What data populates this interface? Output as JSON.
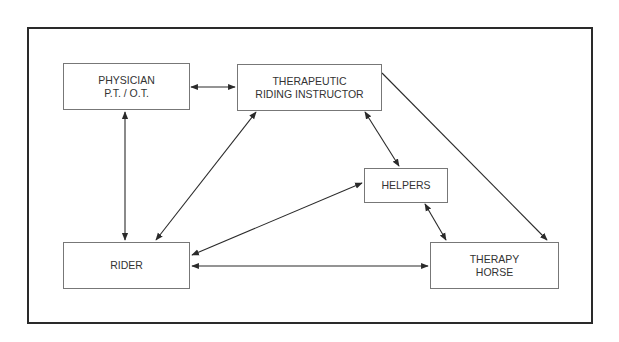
{
  "diagram": {
    "nodes": {
      "physician": {
        "line1": "PHYSICIAN",
        "line2": "P.T. / O.T."
      },
      "instructor": {
        "line1": "THERAPEUTIC",
        "line2": "RIDING INSTRUCTOR"
      },
      "helpers": {
        "line1": "HELPERS"
      },
      "rider": {
        "line1": "RIDER"
      },
      "horse": {
        "line1": "THERAPY",
        "line2": "HORSE"
      }
    },
    "edges": [
      {
        "from": "physician",
        "to": "instructor",
        "direction": "both"
      },
      {
        "from": "physician",
        "to": "rider",
        "direction": "both"
      },
      {
        "from": "instructor",
        "to": "rider",
        "direction": "both"
      },
      {
        "from": "instructor",
        "to": "helpers",
        "direction": "both"
      },
      {
        "from": "instructor",
        "to": "horse",
        "direction": "forward"
      },
      {
        "from": "helpers",
        "to": "rider",
        "direction": "both"
      },
      {
        "from": "helpers",
        "to": "horse",
        "direction": "both"
      },
      {
        "from": "rider",
        "to": "horse",
        "direction": "both"
      }
    ],
    "line_color": "#2a2a2a"
  }
}
